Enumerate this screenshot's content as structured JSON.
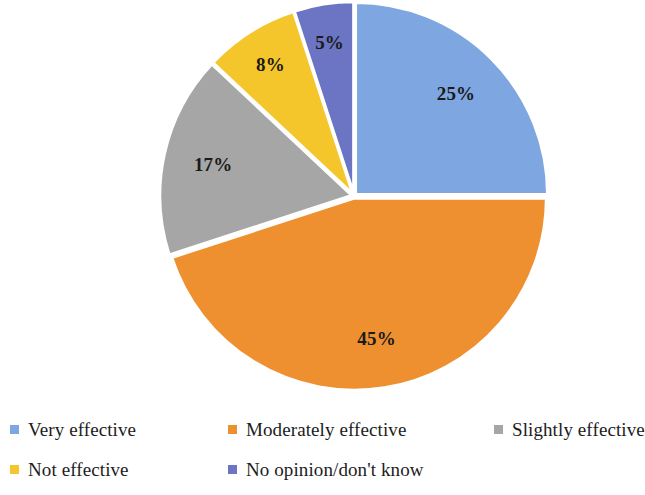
{
  "chart_data": {
    "type": "pie",
    "title": "",
    "subtitle": "",
    "xlabel": "",
    "ylabel": "",
    "grid": false,
    "legend_position": "bottom",
    "start_angle_deg": 0,
    "direction": "clockwise",
    "units": "percent",
    "total": 100,
    "categories": [
      "Very effective",
      "Moderately effective",
      "Slightly effective",
      "Not effective",
      "No opinion/don't know"
    ],
    "values": [
      25,
      45,
      17,
      8,
      5
    ],
    "data_labels": [
      "25%",
      "45%",
      "17%",
      "8%",
      "5%"
    ],
    "colors": [
      "#7ea6e0",
      "#ef9030",
      "#a6a6a6",
      "#f5c62b",
      "#6b75c4"
    ],
    "slices": [
      {
        "label": "Very effective",
        "value": 25,
        "data_label": "25%",
        "color": "#7ea6e0"
      },
      {
        "label": "Moderately effective",
        "value": 45,
        "data_label": "45%",
        "color": "#ef9030"
      },
      {
        "label": "Slightly effective",
        "value": 17,
        "data_label": "17%",
        "color": "#a6a6a6"
      },
      {
        "label": "Not effective",
        "value": 8,
        "data_label": "8%",
        "color": "#f5c62b"
      },
      {
        "label": "No opinion/don't know",
        "value": 5,
        "data_label": "5%",
        "color": "#6b75c4"
      }
    ]
  },
  "geometry": {
    "center_x": 354,
    "center_y": 196,
    "radius": 192,
    "explode_gap": 2.2,
    "label_radius_factor": 0.74
  },
  "legend": {
    "items": [
      {
        "label": "Very effective",
        "color": "#7ea6e0"
      },
      {
        "label": "Moderately effective",
        "color": "#ef9030"
      },
      {
        "label": "Slightly effective",
        "color": "#a6a6a6"
      },
      {
        "label": "Not effective",
        "color": "#f5c62b"
      },
      {
        "label": "No opinion/don't know",
        "color": "#6b75c4"
      }
    ]
  }
}
